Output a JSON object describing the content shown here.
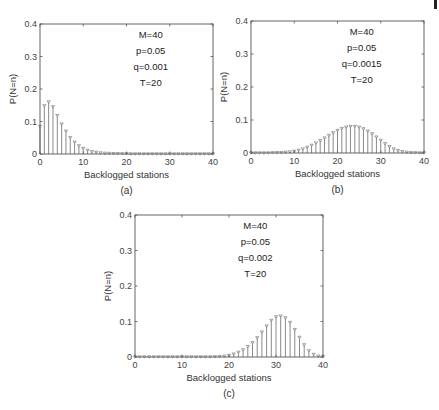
{
  "chart_data": [
    {
      "id": "a",
      "type": "stem",
      "caption": "(a)",
      "xlabel": "Backlogged stations",
      "ylabel": "P(N=n)",
      "xlim": [
        0,
        40
      ],
      "ylim": [
        0,
        0.4
      ],
      "xticks": [
        0,
        10,
        20,
        30,
        40
      ],
      "yticks": [
        0,
        0.1,
        0.2,
        0.3,
        0.4
      ],
      "ytick_labels": [
        "0",
        "0.1",
        "0.2",
        "0.3",
        "0.4"
      ],
      "annotations": [
        "M=40",
        "p=0.05",
        "q=0.001",
        "T=20"
      ],
      "x": [
        0,
        1,
        2,
        3,
        4,
        5,
        6,
        7,
        8,
        9,
        10,
        11,
        12,
        13,
        14,
        15,
        16,
        17,
        18,
        19,
        20,
        21,
        22,
        23,
        24,
        25,
        26,
        27,
        28,
        29,
        30,
        31,
        32,
        33,
        34,
        35,
        36,
        37,
        38,
        39,
        40
      ],
      "values": [
        0.085,
        0.148,
        0.16,
        0.145,
        0.118,
        0.092,
        0.07,
        0.05,
        0.036,
        0.025,
        0.017,
        0.011,
        0.007,
        0.005,
        0.003,
        0.002,
        0.0015,
        0.001,
        0.001,
        0.0005,
        0.0005,
        0,
        0,
        0,
        0,
        0,
        0,
        0,
        0,
        0,
        0,
        0,
        0,
        0,
        0,
        0,
        0,
        0,
        0,
        0,
        0
      ],
      "grid": false,
      "color": "#8a8a8a"
    },
    {
      "id": "b",
      "type": "stem",
      "caption": "(b)",
      "xlabel": "Backlogged stations",
      "ylabel": "P(N=n)",
      "xlim": [
        0,
        40
      ],
      "ylim": [
        0,
        0.4
      ],
      "xticks": [
        0,
        10,
        20,
        30,
        40
      ],
      "yticks": [
        0,
        0.1,
        0.2,
        0.3,
        0.4
      ],
      "ytick_labels": [
        "0",
        "0.1",
        "0.2",
        "0.3",
        "0.4"
      ],
      "annotations": [
        "M=40",
        "p=0.05",
        "q=0.0015",
        "T=20"
      ],
      "x": [
        0,
        1,
        2,
        3,
        4,
        5,
        6,
        7,
        8,
        9,
        10,
        11,
        12,
        13,
        14,
        15,
        16,
        17,
        18,
        19,
        20,
        21,
        22,
        23,
        24,
        25,
        26,
        27,
        28,
        29,
        30,
        31,
        32,
        33,
        34,
        35,
        36,
        37,
        38,
        39,
        40
      ],
      "values": [
        0,
        0,
        0,
        0,
        0,
        0.0005,
        0.001,
        0.001,
        0.002,
        0.003,
        0.005,
        0.008,
        0.012,
        0.017,
        0.023,
        0.03,
        0.037,
        0.045,
        0.053,
        0.061,
        0.068,
        0.074,
        0.078,
        0.08,
        0.08,
        0.078,
        0.073,
        0.066,
        0.058,
        0.048,
        0.038,
        0.028,
        0.019,
        0.012,
        0.007,
        0.004,
        0.002,
        0.001,
        0.0005,
        0,
        0
      ],
      "grid": false,
      "color": "#8a8a8a"
    },
    {
      "id": "c",
      "type": "stem",
      "caption": "(c)",
      "xlabel": "Backlogged stations",
      "ylabel": "P(N=n)",
      "xlim": [
        0,
        40
      ],
      "ylim": [
        0,
        0.4
      ],
      "xticks": [
        0,
        10,
        20,
        30,
        40
      ],
      "yticks": [
        0,
        0.1,
        0.2,
        0.3,
        0.4
      ],
      "ytick_labels": [
        "0",
        "0.1",
        "0.2",
        "0.3",
        "0.4"
      ],
      "annotations": [
        "M=40",
        "p=0.05",
        "q=0.002",
        "T=20"
      ],
      "x": [
        0,
        1,
        2,
        3,
        4,
        5,
        6,
        7,
        8,
        9,
        10,
        11,
        12,
        13,
        14,
        15,
        16,
        17,
        18,
        19,
        20,
        21,
        22,
        23,
        24,
        25,
        26,
        27,
        28,
        29,
        30,
        31,
        32,
        33,
        34,
        35,
        36,
        37,
        38,
        39,
        40
      ],
      "values": [
        0,
        0,
        0,
        0,
        0,
        0,
        0,
        0,
        0,
        0,
        0,
        0,
        0,
        0,
        0,
        0,
        0,
        0.0005,
        0.001,
        0.002,
        0.004,
        0.008,
        0.013,
        0.02,
        0.029,
        0.04,
        0.054,
        0.07,
        0.087,
        0.103,
        0.113,
        0.115,
        0.11,
        0.097,
        0.077,
        0.055,
        0.034,
        0.017,
        0.007,
        0.002,
        0.0005
      ],
      "grid": false,
      "color": "#8a8a8a"
    }
  ],
  "panels_layout": [
    {
      "id": "a",
      "left": 40,
      "right": 213,
      "top": 24,
      "bottom": 154
    },
    {
      "id": "b",
      "left": 251,
      "right": 424,
      "top": 21,
      "bottom": 153
    },
    {
      "id": "c",
      "left": 135,
      "right": 323,
      "top": 215,
      "bottom": 357
    }
  ]
}
